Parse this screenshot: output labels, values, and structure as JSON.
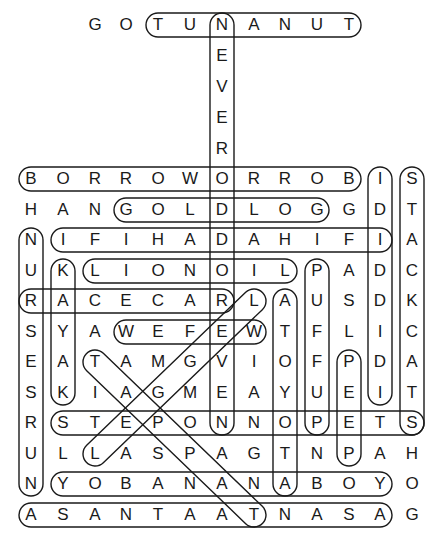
{
  "puzzle": {
    "type": "word-search",
    "columns_x": [
      31,
      63,
      95,
      126,
      158,
      190,
      222,
      254,
      285,
      317,
      349,
      380,
      412
    ],
    "rows_y": [
      25,
      56,
      87,
      118,
      149,
      179,
      210,
      240,
      271,
      301,
      332,
      362,
      393,
      423,
      454,
      484,
      515
    ],
    "rows": [
      "  GOTUNANUT  ",
      "      E      ",
      "      V      ",
      "      E      ",
      "      R      ",
      "BORROWORROBIS",
      "HANGOLDLOGGDT",
      "NIFIHADAHIFIA",
      "UKLIONOILPADC",
      "RACECARLAUSDK",
      "SYAWEFEWTFLIC",
      "EATAMGVIOFPDA",
      "SKIAGMEAYUEIT",
      "RSTEPONNOPETS",
      "ULLASPAGTNPAH",
      "NYOBANANABOYO",
      "ASANTAATNASAG"
    ],
    "found_words": [
      {
        "word": "TUNANUT",
        "from": [
          0,
          4
        ],
        "to": [
          0,
          10
        ]
      },
      {
        "word": "NEVERODDOREVEN",
        "from": [
          0,
          6
        ],
        "to": [
          13,
          6
        ]
      },
      {
        "word": "BORROWORROB",
        "from": [
          5,
          0
        ],
        "to": [
          5,
          10
        ]
      },
      {
        "word": "IDIDIDI",
        "from": [
          5,
          11
        ],
        "to": [
          12,
          11
        ]
      },
      {
        "word": "STACKCATS",
        "from": [
          5,
          12
        ],
        "to": [
          13,
          12
        ]
      },
      {
        "word": "GOLDLOG",
        "from": [
          6,
          3
        ],
        "to": [
          6,
          9
        ]
      },
      {
        "word": "IFIHADAHIFI",
        "from": [
          7,
          1
        ],
        "to": [
          7,
          11
        ]
      },
      {
        "word": "NURSESRUN",
        "from": [
          7,
          0
        ],
        "to": [
          15,
          0
        ]
      },
      {
        "word": "KAYAK",
        "from": [
          8,
          1
        ],
        "to": [
          12,
          1
        ]
      },
      {
        "word": "LIONOIL",
        "from": [
          8,
          2
        ],
        "to": [
          8,
          8
        ]
      },
      {
        "word": "PUFFUP",
        "from": [
          8,
          9
        ],
        "to": [
          13,
          9
        ]
      },
      {
        "word": "RACECAR",
        "from": [
          9,
          0
        ],
        "to": [
          9,
          6
        ]
      },
      {
        "word": "ATOYOTA",
        "from": [
          9,
          8
        ],
        "to": [
          15,
          8
        ]
      },
      {
        "word": "WEFEW",
        "from": [
          10,
          3
        ],
        "to": [
          10,
          7
        ]
      },
      {
        "word": "PEEP",
        "from": [
          11,
          10
        ],
        "to": [
          14,
          10
        ]
      },
      {
        "word": "STEPONNOPETS",
        "from": [
          13,
          1
        ],
        "to": [
          13,
          12
        ]
      },
      {
        "word": "YOBANANABOY",
        "from": [
          15,
          1
        ],
        "to": [
          15,
          11
        ]
      },
      {
        "word": "ASANTAATNASA",
        "from": [
          16,
          0
        ],
        "to": [
          16,
          11
        ]
      },
      {
        "word": "LEGGEL",
        "from": [
          9,
          7
        ],
        "to": [
          14,
          2
        ]
      },
      {
        "word": "TAPPAT",
        "from": [
          11,
          2
        ],
        "to": [
          16,
          7
        ]
      }
    ],
    "colors": {
      "ink": "#1a1a1a",
      "background": "#ffffff"
    }
  }
}
